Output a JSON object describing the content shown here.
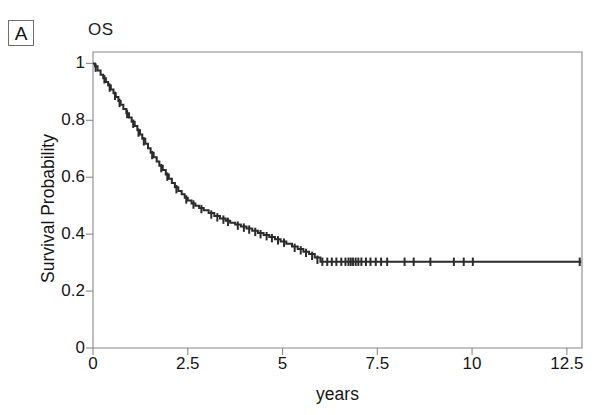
{
  "figure": {
    "panel_label": "A",
    "title": "OS",
    "background_color": "#ffffff",
    "line_color": "#2b2b2b",
    "axis_color": "#8a8a8a"
  },
  "chart_data": {
    "type": "line",
    "subtype": "kaplan-meier-survival-curve",
    "title": "OS",
    "xlabel": "years",
    "ylabel": "Survival Probability",
    "xlim": [
      0,
      12.9
    ],
    "ylim": [
      0,
      1.04
    ],
    "grid": false,
    "legend": null,
    "xticks": [
      0,
      2.5,
      5,
      7.5,
      10,
      12.5
    ],
    "xticklabels": [
      "0",
      "2.5",
      "5",
      "7.5",
      "10",
      "12.5"
    ],
    "yticks": [
      0,
      0.2,
      0.4,
      0.6,
      0.8,
      1
    ],
    "yticklabels": [
      "0",
      "0.2",
      "0.4",
      "0.6",
      "0.8",
      "1"
    ],
    "series": [
      {
        "name": "Overall Survival",
        "step": "post",
        "x": [
          0,
          0.05,
          0.12,
          0.2,
          0.27,
          0.34,
          0.4,
          0.47,
          0.54,
          0.6,
          0.67,
          0.73,
          0.8,
          0.88,
          0.95,
          1.02,
          1.1,
          1.17,
          1.24,
          1.3,
          1.38,
          1.45,
          1.52,
          1.6,
          1.68,
          1.75,
          1.84,
          1.92,
          2.0,
          2.08,
          2.16,
          2.25,
          2.34,
          2.42,
          2.5,
          2.6,
          2.7,
          2.8,
          2.92,
          3.05,
          3.2,
          3.35,
          3.5,
          3.62,
          3.75,
          3.9,
          4.05,
          4.2,
          4.35,
          4.5,
          4.65,
          4.8,
          4.95,
          5.1,
          5.25,
          5.4,
          5.55,
          5.7,
          5.85,
          6.0,
          12.88
        ],
        "y": [
          1.0,
          0.99,
          0.975,
          0.96,
          0.948,
          0.935,
          0.922,
          0.908,
          0.895,
          0.882,
          0.868,
          0.855,
          0.84,
          0.825,
          0.81,
          0.795,
          0.78,
          0.765,
          0.75,
          0.735,
          0.718,
          0.702,
          0.686,
          0.67,
          0.655,
          0.64,
          0.625,
          0.61,
          0.595,
          0.58,
          0.565,
          0.552,
          0.54,
          0.528,
          0.518,
          0.508,
          0.5,
          0.492,
          0.484,
          0.474,
          0.464,
          0.455,
          0.447,
          0.44,
          0.434,
          0.427,
          0.42,
          0.412,
          0.404,
          0.397,
          0.39,
          0.382,
          0.374,
          0.366,
          0.357,
          0.348,
          0.338,
          0.33,
          0.318,
          0.303,
          0.303
        ],
        "censored_points": [
          {
            "x": 0.07,
            "y": 0.985
          },
          {
            "x": 0.3,
            "y": 0.944
          },
          {
            "x": 0.44,
            "y": 0.915
          },
          {
            "x": 0.58,
            "y": 0.886
          },
          {
            "x": 0.7,
            "y": 0.861
          },
          {
            "x": 0.9,
            "y": 0.822
          },
          {
            "x": 1.06,
            "y": 0.788
          },
          {
            "x": 1.2,
            "y": 0.757
          },
          {
            "x": 1.34,
            "y": 0.726
          },
          {
            "x": 1.56,
            "y": 0.678
          },
          {
            "x": 1.8,
            "y": 0.632
          },
          {
            "x": 1.96,
            "y": 0.602
          },
          {
            "x": 2.2,
            "y": 0.558
          },
          {
            "x": 2.46,
            "y": 0.522
          },
          {
            "x": 2.65,
            "y": 0.504
          },
          {
            "x": 2.86,
            "y": 0.488
          },
          {
            "x": 3.12,
            "y": 0.469
          },
          {
            "x": 3.28,
            "y": 0.459
          },
          {
            "x": 3.44,
            "y": 0.451
          },
          {
            "x": 3.56,
            "y": 0.443
          },
          {
            "x": 3.82,
            "y": 0.43
          },
          {
            "x": 3.98,
            "y": 0.423
          },
          {
            "x": 4.12,
            "y": 0.416
          },
          {
            "x": 4.28,
            "y": 0.408
          },
          {
            "x": 4.42,
            "y": 0.4
          },
          {
            "x": 4.58,
            "y": 0.393
          },
          {
            "x": 4.72,
            "y": 0.386
          },
          {
            "x": 4.88,
            "y": 0.378
          },
          {
            "x": 5.04,
            "y": 0.37
          },
          {
            "x": 5.32,
            "y": 0.352
          },
          {
            "x": 5.48,
            "y": 0.343
          },
          {
            "x": 5.62,
            "y": 0.334
          },
          {
            "x": 5.78,
            "y": 0.324
          },
          {
            "x": 5.92,
            "y": 0.31
          },
          {
            "x": 6.05,
            "y": 0.303
          },
          {
            "x": 6.18,
            "y": 0.303
          },
          {
            "x": 6.3,
            "y": 0.303
          },
          {
            "x": 6.42,
            "y": 0.303
          },
          {
            "x": 6.55,
            "y": 0.303
          },
          {
            "x": 6.66,
            "y": 0.303
          },
          {
            "x": 6.74,
            "y": 0.303
          },
          {
            "x": 6.8,
            "y": 0.303
          },
          {
            "x": 6.86,
            "y": 0.303
          },
          {
            "x": 6.93,
            "y": 0.303
          },
          {
            "x": 7.0,
            "y": 0.303
          },
          {
            "x": 7.08,
            "y": 0.303
          },
          {
            "x": 7.2,
            "y": 0.303
          },
          {
            "x": 7.32,
            "y": 0.303
          },
          {
            "x": 7.46,
            "y": 0.303
          },
          {
            "x": 7.6,
            "y": 0.303
          },
          {
            "x": 7.76,
            "y": 0.303
          },
          {
            "x": 8.22,
            "y": 0.303
          },
          {
            "x": 8.46,
            "y": 0.303
          },
          {
            "x": 8.9,
            "y": 0.303
          },
          {
            "x": 9.52,
            "y": 0.303
          },
          {
            "x": 9.78,
            "y": 0.303
          },
          {
            "x": 10.02,
            "y": 0.303
          },
          {
            "x": 12.84,
            "y": 0.303
          }
        ]
      }
    ],
    "annotations": [
      {
        "text": "A",
        "role": "panel-label"
      }
    ]
  }
}
